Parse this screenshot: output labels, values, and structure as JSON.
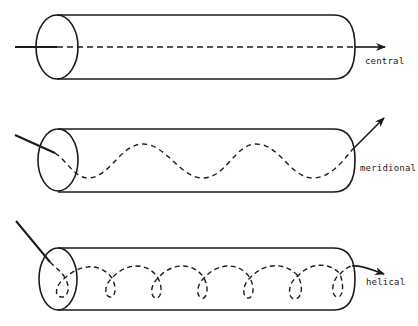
{
  "diagram": {
    "type": "ray-propagation-in-optical-fiber",
    "colors": {
      "stroke": "#1a1a1a",
      "background": "#ffffff"
    },
    "panels": [
      {
        "id": "central",
        "label": "central",
        "ray_type": "straight along axis",
        "label_pos": {
          "x": 365,
          "y": 56
        }
      },
      {
        "id": "meridional",
        "label": "meridional",
        "ray_type": "zig-zag through axis",
        "label_pos": {
          "x": 360,
          "y": 163
        }
      },
      {
        "id": "helical",
        "label": "helical",
        "ray_type": "spiral around axis",
        "label_pos": {
          "x": 366,
          "y": 277
        }
      }
    ]
  }
}
